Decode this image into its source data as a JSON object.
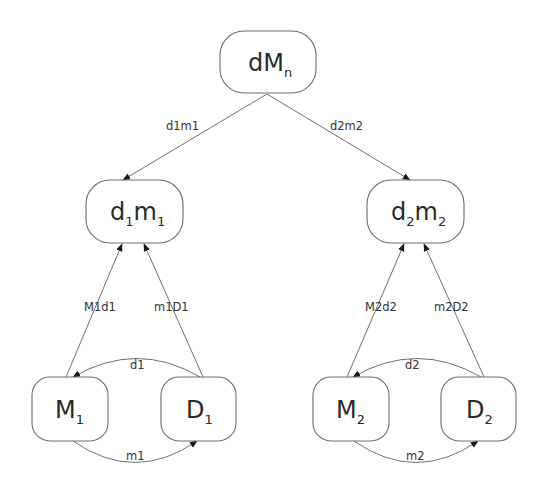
{
  "diagram": {
    "type": "directed-graph",
    "colors": {
      "node_border": "#6e6e6e",
      "edge": "#707070",
      "arrowhead": "#1a1a1a",
      "text": "#2a2a2a",
      "background": "#ffffff"
    },
    "nodes": {
      "dMn": {
        "base": "dM",
        "sub": "n"
      },
      "d1m1": {
        "base1": "d",
        "sub1": "1",
        "base2": "m",
        "sub2": "1"
      },
      "d2m2": {
        "base1": "d",
        "sub1": "2",
        "base2": "m",
        "sub2": "2"
      },
      "M1": {
        "base": "M",
        "sub": "1"
      },
      "D1": {
        "base": "D",
        "sub": "1"
      },
      "M2": {
        "base": "M",
        "sub": "2"
      },
      "D2": {
        "base": "D",
        "sub": "2"
      }
    },
    "edges": [
      {
        "id": "d1m1",
        "from": "dMn",
        "to": "d1m1",
        "label": "d1m1"
      },
      {
        "id": "d2m2",
        "from": "dMn",
        "to": "d2m2",
        "label": "d2m2"
      },
      {
        "id": "M1d1",
        "from": "M1",
        "to": "d1m1",
        "label": "M1d1"
      },
      {
        "id": "m1D1",
        "from": "D1",
        "to": "d1m1",
        "label": "m1D1"
      },
      {
        "id": "M2d2",
        "from": "M2",
        "to": "d2m2",
        "label": "M2d2"
      },
      {
        "id": "m2D2",
        "from": "D2",
        "to": "d2m2",
        "label": "m2D2"
      },
      {
        "id": "d1",
        "from": "D1",
        "to": "M1",
        "label": "d1"
      },
      {
        "id": "m1",
        "from": "M1",
        "to": "D1",
        "label": "m1"
      },
      {
        "id": "d2",
        "from": "D2",
        "to": "M2",
        "label": "d2"
      },
      {
        "id": "m2",
        "from": "M2",
        "to": "D2",
        "label": "m2"
      }
    ]
  }
}
